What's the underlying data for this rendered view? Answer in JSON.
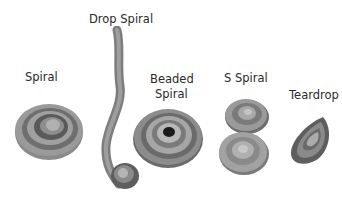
{
  "labels": {
    "spiral": "Spiral",
    "drop_spiral": "Drop Spiral",
    "beaded_spiral_1": "Beaded",
    "beaded_spiral_2": "Spiral",
    "s_spiral": "S Spiral",
    "teardrop": "Teardrop"
  },
  "colors": {
    "dark": "#4a4a4a",
    "mid": "#7a7a7a",
    "light": "#a8a8a8",
    "pale": "#c4c4c4",
    "center": "#1a1a1a"
  }
}
